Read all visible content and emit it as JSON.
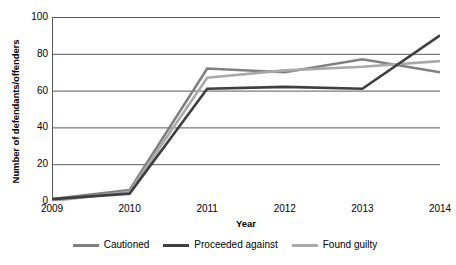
{
  "chart_data": {
    "type": "line",
    "title": "",
    "xlabel": "Year",
    "ylabel": "Number of defendants/offenders",
    "categories": [
      "2009",
      "2010",
      "2011",
      "2012",
      "2013",
      "2014"
    ],
    "ylim": [
      0,
      100
    ],
    "yticks": [
      0,
      20,
      40,
      60,
      80,
      100
    ],
    "grid": true,
    "legend_position": "bottom",
    "series": [
      {
        "name": "Cautioned",
        "color": "#808080",
        "values": [
          1,
          6,
          72,
          70,
          77,
          70
        ]
      },
      {
        "name": "Proceeded against",
        "color": "#3f3f3f",
        "values": [
          1,
          4,
          61,
          62,
          61,
          90
        ]
      },
      {
        "name": "Found guilty",
        "color": "#a9a9a9",
        "values": [
          0,
          5,
          67,
          71,
          73,
          76
        ]
      }
    ]
  },
  "axis": {
    "y_tick_labels": [
      "100",
      "80",
      "60",
      "40",
      "20",
      "0"
    ],
    "x_tick_labels": [
      "2009",
      "2010",
      "2011",
      "2012",
      "2013",
      "2014"
    ],
    "x_title": "Year",
    "y_title": "Number of defendants/offenders"
  },
  "legend": {
    "items": [
      {
        "label": "Cautioned",
        "color": "#808080"
      },
      {
        "label": "Proceeded against",
        "color": "#3f3f3f"
      },
      {
        "label": "Found guilty",
        "color": "#a9a9a9"
      }
    ]
  },
  "style": {
    "grid_color": "#595959",
    "axis_color": "#595959",
    "background": "#ffffff"
  }
}
